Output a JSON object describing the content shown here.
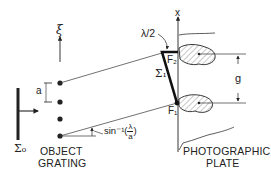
{
  "diagram": {
    "labels": {
      "xi": "ξ",
      "x_axis": "x",
      "lambda_half": "λ/2",
      "sigma0": "Σ₀",
      "sigma1": "Σ₁",
      "f1": "F₁",
      "f2": "F₂",
      "grating_spacing": "a",
      "separation": "g",
      "angle_prefix": "sin⁻¹(",
      "angle_num": "λ",
      "angle_den": "a",
      "angle_suffix": ")",
      "object_grating_line1": "OBJECT",
      "object_grating_line2": "GRATING",
      "plate_line1": "PHOTOGRAPHIC",
      "plate_line2": "PLATE"
    },
    "colors": {
      "ink": "#222222",
      "background": "#ffffff",
      "hatch": "#555555"
    }
  }
}
